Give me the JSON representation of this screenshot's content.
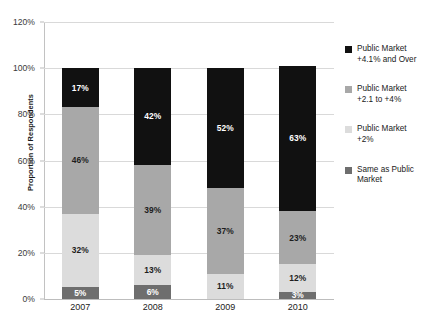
{
  "chart_data": {
    "type": "bar",
    "subtype": "stacked-column",
    "title": "",
    "xlabel": "",
    "ylabel": "Proportion of Respondents",
    "categories": [
      "2007",
      "2008",
      "2009",
      "2010"
    ],
    "ylim": [
      0,
      120
    ],
    "ytick_values": [
      0,
      20,
      40,
      60,
      80,
      100,
      120
    ],
    "ytick_labels": [
      "0%",
      "20%",
      "40%",
      "60%",
      "80%",
      "100%",
      "120%"
    ],
    "grid": true,
    "legend_position": "right",
    "series": [
      {
        "name": "Same as Public Market",
        "color": "#6e6e6e",
        "values": [
          5,
          6,
          0,
          3
        ],
        "labels": [
          "5%",
          "6%",
          "",
          "3%"
        ]
      },
      {
        "name": "Public Market\n+2%",
        "color": "#dcdcdc",
        "values": [
          32,
          13,
          11,
          12
        ],
        "labels": [
          "32%",
          "13%",
          "11%",
          "12%"
        ]
      },
      {
        "name": "Public Market\n+2.1 to +4%",
        "color": "#a8a8a8",
        "values": [
          46,
          39,
          37,
          23
        ],
        "labels": [
          "46%",
          "39%",
          "37%",
          "23%"
        ]
      },
      {
        "name": "Public Market\n+4.1% and Over",
        "color": "#111111",
        "values": [
          17,
          42,
          52,
          63
        ],
        "labels": [
          "17%",
          "42%",
          "52%",
          "63%"
        ]
      }
    ]
  },
  "axis": {
    "y_title": "Proportion of Respondents",
    "ticks": [
      {
        "label": "120%"
      },
      {
        "label": "100%"
      },
      {
        "label": "80%"
      },
      {
        "label": "60%"
      },
      {
        "label": "40%"
      },
      {
        "label": "20%"
      },
      {
        "label": "0%"
      }
    ],
    "x_categories": [
      {
        "label": "2007"
      },
      {
        "label": "2008"
      },
      {
        "label": "2009"
      },
      {
        "label": "2010"
      }
    ]
  },
  "legend": {
    "items": [
      {
        "label": "Public Market\n+4.1% and Over",
        "color": "#111111"
      },
      {
        "label": "Public Market\n+2.1 to +4%",
        "color": "#a8a8a8"
      },
      {
        "label": "Public Market\n+2%",
        "color": "#dcdcdc"
      },
      {
        "label": "Same as Public\nMarket",
        "color": "#6e6e6e"
      }
    ]
  }
}
